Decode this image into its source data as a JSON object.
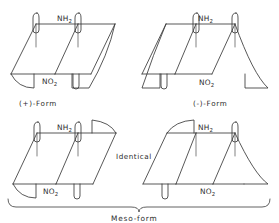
{
  "figure": {
    "background_color": "#ffffff",
    "line_color": "#3a3a3a",
    "text_color": "#2c2c2c",
    "top_cropped_caption": "",
    "type": "chemical-stereochemistry-diagram"
  },
  "structures": [
    {
      "id": "top-left",
      "position": "top-left",
      "top_label": "NH",
      "top_label_sub": "2",
      "bottom_label": "NO",
      "bottom_label_sub": "2",
      "form_label": "(+)-Form"
    },
    {
      "id": "top-right",
      "position": "top-right",
      "top_label": "NH",
      "top_label_sub": "2",
      "bottom_label": "NO",
      "bottom_label_sub": "2",
      "form_label": "(-)-Form"
    },
    {
      "id": "bottom-left",
      "position": "bottom-left",
      "top_label": "NH",
      "top_label_sub": "2",
      "bottom_label": "NO",
      "bottom_label_sub": "2",
      "form_label": ""
    },
    {
      "id": "bottom-right",
      "position": "bottom-right",
      "top_label": "NH",
      "top_label_sub": "2",
      "bottom_label": "NO",
      "bottom_label_sub": "2",
      "form_label": ""
    }
  ],
  "annotations": {
    "identical": "Identical",
    "meso": "Meso-form"
  }
}
